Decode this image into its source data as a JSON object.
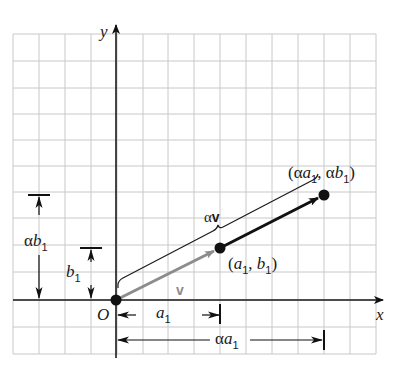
{
  "figure": {
    "axes": {
      "x_label": "x",
      "y_label": "y",
      "origin_label": "O"
    },
    "grid": {
      "left": 13,
      "top": 34,
      "right": 376,
      "bottom": 354,
      "cell": 25.9,
      "color": "#c8c8c8"
    },
    "colors": {
      "axis": "#1a1a1a",
      "vector_v": "#8c8c8c",
      "vector_alpha_v": "#111111",
      "grid": "#c8c8c8"
    },
    "points": [
      {
        "name": "origin",
        "label": "O",
        "px": [
          116,
          300
        ]
      },
      {
        "name": "point-a1-b1",
        "label_parts": [
          "(",
          "a",
          "1",
          ", ",
          "b",
          "1",
          ")"
        ],
        "label": "(a1, b1)",
        "px": [
          220,
          248
        ]
      },
      {
        "name": "point-alpha-a1-alpha-b1",
        "label": "(αa1, αb1)",
        "px": [
          324,
          195
        ]
      }
    ],
    "labels": {
      "v": "v",
      "alpha_v_alpha": "α",
      "alpha_v_v": "v",
      "a1_base": "a",
      "a1_sub": "1",
      "alpha_a1_alpha": "α",
      "alpha_a1_base": "a",
      "alpha_a1_sub": "1",
      "b1_base": "b",
      "b1_sub": "1",
      "alpha_b1_alpha": "α",
      "alpha_b1_base": "b",
      "alpha_b1_sub": "1",
      "pt1_open": "(",
      "pt1_a": "a",
      "pt1_sub_a": "1",
      "pt1_comma": ", ",
      "pt1_b": "b",
      "pt1_sub_b": "1",
      "pt1_close": ")",
      "pt2_open": "(",
      "pt2_alpha1": "α",
      "pt2_a": "a",
      "pt2_sub_a": "1",
      "pt2_comma": ", ",
      "pt2_alpha2": "α",
      "pt2_b": "b",
      "pt2_sub_b": "1",
      "pt2_close": ")"
    }
  }
}
